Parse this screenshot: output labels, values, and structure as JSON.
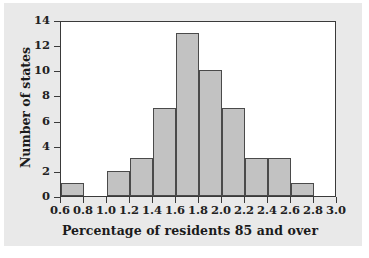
{
  "chart_data": {
    "type": "bar",
    "title": "",
    "xlabel": "Percentage of residents 85 and over",
    "ylabel": "Number of states",
    "xlim": [
      0.6,
      3.0
    ],
    "ylim": [
      0,
      14
    ],
    "grid": false,
    "legend": null,
    "bin_width": 0.2,
    "bin_edges": [
      0.6,
      0.8,
      1.0,
      1.2,
      1.4,
      1.6,
      1.8,
      2.0,
      2.2,
      2.4,
      2.6,
      2.8,
      3.0
    ],
    "categories": [
      "0.6-0.8",
      "0.8-1.0",
      "1.0-1.2",
      "1.2-1.4",
      "1.4-1.6",
      "1.6-1.8",
      "1.8-2.0",
      "2.0-2.2",
      "2.2-2.4",
      "2.4-2.6",
      "2.6-2.8",
      "2.8-3.0"
    ],
    "values": [
      1,
      0,
      2,
      3,
      7,
      13,
      10,
      7,
      3,
      3,
      1,
      0
    ],
    "xticks": [
      "0.6",
      "0.8",
      "1.0",
      "1.2",
      "1.4",
      "1.6",
      "1.8",
      "2.0",
      "2.2",
      "2.4",
      "2.6",
      "2.8",
      "3.0"
    ],
    "xtick_values": [
      0.6,
      0.8,
      1.0,
      1.2,
      1.4,
      1.6,
      1.8,
      2.0,
      2.2,
      2.4,
      2.6,
      2.8,
      3.0
    ],
    "yticks": [
      "0",
      "2",
      "4",
      "6",
      "8",
      "10",
      "12",
      "14"
    ],
    "ytick_values": [
      0,
      2,
      4,
      6,
      8,
      10,
      12,
      14
    ],
    "colors": {
      "bar_fill": "#c2c2c2",
      "bar_edge": "#4a4a4a",
      "axis": "#3a3a3a",
      "plot_background": "#ffffff",
      "figure_background": "#e9e9e9",
      "text": "#1b1b1b"
    }
  }
}
